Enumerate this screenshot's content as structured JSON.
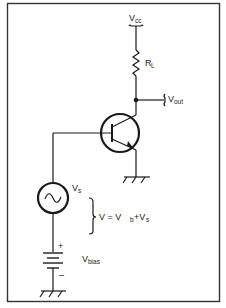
{
  "figure": {
    "type": "circuit-schematic"
  },
  "labels": {
    "vcc": {
      "main": "V",
      "sub": "cc"
    },
    "rl": {
      "main": "R",
      "sub": "L"
    },
    "vout": {
      "main": "V",
      "sub": "out"
    },
    "vs": {
      "main": "V",
      "sub": "s"
    },
    "equation": {
      "prefix": "V = V",
      "sub1": "b",
      "plus": "+V",
      "sub2": "s"
    },
    "vbias": {
      "main": "V",
      "sub": "bias"
    },
    "plus_sign": "+",
    "minus_sign": "–"
  },
  "components": [
    {
      "id": "vcc-supply",
      "kind": "supply-rail"
    },
    {
      "id": "load-resistor",
      "kind": "resistor",
      "label": "RL"
    },
    {
      "id": "output-node",
      "kind": "junction",
      "label": "Vout"
    },
    {
      "id": "npn-transistor",
      "kind": "bipolar-transistor"
    },
    {
      "id": "emitter-ground",
      "kind": "ground"
    },
    {
      "id": "signal-source",
      "kind": "ac-source",
      "label": "Vs"
    },
    {
      "id": "bias-battery",
      "kind": "battery",
      "label": "Vbias"
    },
    {
      "id": "source-ground",
      "kind": "ground"
    }
  ],
  "colors": {
    "ink": "#1a1a1a",
    "background": "#ffffff",
    "frame": "#333333"
  }
}
